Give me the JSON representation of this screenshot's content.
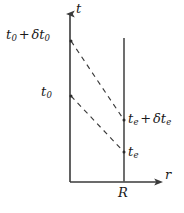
{
  "figure": {
    "type": "spacetime-diagram",
    "background_color": "#ffffff",
    "line_color": "#3a3a3a",
    "text_color": "#1a1a1a",
    "axes": {
      "vertical_axis_label": "t",
      "horizontal_axis_label": "r",
      "vertical_axis_x": 70,
      "horizontal_axis_y": 182,
      "vertical_axis_top": 10,
      "horizontal_axis_right": 163
    },
    "worldline": {
      "name": "observer-worldline-at-R",
      "label": "R",
      "x": 124,
      "y_top": 38,
      "y_bottom": 182
    },
    "rays": [
      {
        "name": "upper-light-ray",
        "style": "dashed",
        "start_label": "t_0 + δt_0",
        "end_label": "t_e + δt_e",
        "x1": 71,
        "y1": 41,
        "x2": 124,
        "y2": 120
      },
      {
        "name": "lower-light-ray",
        "style": "dashed",
        "start_label": "t_0",
        "end_label": "t_e",
        "x1": 71,
        "y1": 96,
        "x2": 124,
        "y2": 152
      }
    ],
    "labels": {
      "t0_plus_dt0": {
        "base": "t",
        "sub": "0",
        "op": "+",
        "delta": "δ",
        "base2": "t",
        "sub2": "0"
      },
      "t0": {
        "base": "t",
        "sub": "0"
      },
      "te_plus_dte": {
        "base": "t",
        "sub": "e",
        "op": "+",
        "delta": "δ",
        "base2": "t",
        "sub2": "e"
      },
      "te": {
        "base": "t",
        "sub": "e"
      },
      "t_axis": "t",
      "r_axis": "r",
      "R_tick": "R"
    }
  }
}
